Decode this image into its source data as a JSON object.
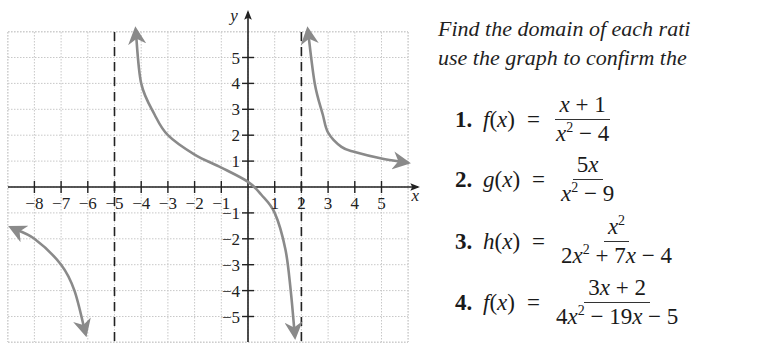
{
  "chart_data": {
    "type": "line",
    "title": "",
    "xlabel": "x",
    "ylabel": "y",
    "xlim": [
      -9,
      6
    ],
    "ylim": [
      -6,
      6.5
    ],
    "grid": true,
    "x_ticks": [
      -8,
      -7,
      -6,
      -5,
      -4,
      -3,
      -2,
      -1,
      1,
      2,
      3,
      4,
      5
    ],
    "y_ticks": [
      -5,
      -4,
      -3,
      -2,
      -1,
      1,
      2,
      3,
      4,
      5
    ],
    "x_tick_labels": [
      "−8",
      "−7",
      "−6",
      "−5",
      "−4",
      "−3",
      "−2",
      "−1",
      "1",
      "2",
      "3",
      "4",
      "5"
    ],
    "y_tick_labels": [
      "−5",
      "−4",
      "−3",
      "−2",
      "−1",
      "1",
      "2",
      "3",
      "4",
      "5"
    ],
    "vertical_asymptotes": [
      -5,
      2
    ],
    "horizontal_asymptote": 0,
    "series": [
      {
        "name": "left-branch",
        "points": [
          [
            -8.8,
            -1.6
          ],
          [
            -8,
            -2.0
          ],
          [
            -7,
            -3.0
          ],
          [
            -6.5,
            -4.0
          ],
          [
            -6.1,
            -5.6
          ]
        ]
      },
      {
        "name": "middle-branch",
        "points": [
          [
            -4.2,
            6.0
          ],
          [
            -4,
            4.0
          ],
          [
            -3.5,
            2.8
          ],
          [
            -3,
            2.0
          ],
          [
            -2,
            1.25
          ],
          [
            -1,
            0.75
          ],
          [
            0,
            0.2
          ],
          [
            0.5,
            -0.3
          ],
          [
            1,
            -1.0
          ],
          [
            1.4,
            -2.4
          ],
          [
            1.6,
            -4.0
          ],
          [
            1.75,
            -5.7
          ]
        ]
      },
      {
        "name": "right-branch",
        "points": [
          [
            2.25,
            6.0
          ],
          [
            2.5,
            4.0
          ],
          [
            2.8,
            2.8
          ],
          [
            3,
            2.1
          ],
          [
            3.5,
            1.55
          ],
          [
            4,
            1.35
          ],
          [
            5,
            1.1
          ],
          [
            5.9,
            0.95
          ]
        ]
      }
    ]
  },
  "graph": {
    "x_axis_label": "x",
    "y_axis_label": "y"
  },
  "text": {
    "instruction_line1": "Find the domain of each rati",
    "instruction_line2": "use the graph to confirm the"
  },
  "problems": [
    {
      "number": "1.",
      "fname": "f",
      "var": "(x)",
      "eq": "=",
      "numerator": "x + 1",
      "denominator_html": "x2 − 4"
    },
    {
      "number": "2.",
      "fname": "g",
      "var": "(x)",
      "eq": "=",
      "numerator": "5x",
      "denominator_html": "x2 − 9"
    },
    {
      "number": "3.",
      "fname": "h",
      "var": "(x)",
      "eq": "=",
      "numerator": "x2",
      "denominator_html": "2x2 + 7x − 4"
    },
    {
      "number": "4.",
      "fname": "f",
      "var": "(x)",
      "eq": "=",
      "numerator": "3x + 2",
      "denominator_html": "4x2 − 19x − 5"
    }
  ]
}
